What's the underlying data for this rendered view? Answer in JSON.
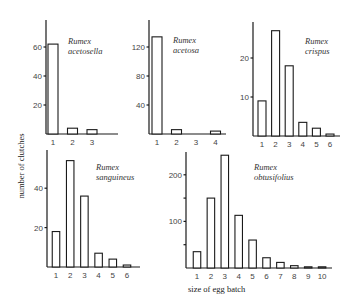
{
  "figure": {
    "ylabel": "number of clutches",
    "xlabel": "size of egg batch"
  },
  "chart_data": [
    {
      "type": "bar",
      "title": "Rumex acetosella",
      "title_lines": [
        "Rumex",
        "acetosella"
      ],
      "categories": [
        "1",
        "2",
        "3"
      ],
      "values": [
        62,
        4,
        3
      ],
      "xlabel": "size of egg batch",
      "ylabel": "number of clutches",
      "yticks": [
        20,
        40,
        60
      ],
      "ylim": [
        0,
        78
      ],
      "grid": false
    },
    {
      "type": "bar",
      "title": "Rumex acetosa",
      "title_lines": [
        "Rumex",
        "acetosa"
      ],
      "categories": [
        "1",
        "2",
        "3",
        "4"
      ],
      "values": [
        134,
        6,
        0,
        4
      ],
      "xlabel": "size of egg batch",
      "ylabel": "number of clutches",
      "yticks": [
        40,
        80,
        120
      ],
      "ylim": [
        0,
        157
      ],
      "grid": false
    },
    {
      "type": "bar",
      "title": "Rumex crispus",
      "title_lines": [
        "Rumex",
        "crispus"
      ],
      "categories": [
        "1",
        "2",
        "3",
        "4",
        "5",
        "6"
      ],
      "values": [
        9,
        27,
        18,
        3.5,
        2,
        0.5
      ],
      "xlabel": "size of egg batch",
      "ylabel": "number of clutches",
      "yticks": [
        10,
        20
      ],
      "ylim": [
        0,
        29
      ],
      "grid": false
    },
    {
      "type": "bar",
      "title": "Rumex sanguineus",
      "title_lines": [
        "Rumex",
        "sanguineus"
      ],
      "categories": [
        "1",
        "2",
        "3",
        "4",
        "5",
        "6"
      ],
      "values": [
        18,
        54,
        36,
        7,
        4,
        1
      ],
      "xlabel": "size of egg batch",
      "ylabel": "number of clutches",
      "yticks": [
        20,
        40
      ],
      "ylim": [
        0,
        59
      ],
      "grid": false
    },
    {
      "type": "bar",
      "title": "Rumex obtusifolius",
      "title_lines": [
        "Rumex",
        "obtusifolius"
      ],
      "categories": [
        "1",
        "2",
        "3",
        "4",
        "5",
        "6",
        "7",
        "8",
        "9",
        "10"
      ],
      "values": [
        35,
        150,
        242,
        113,
        60,
        22,
        12,
        5,
        1,
        0.5
      ],
      "xlabel": "size of egg batch",
      "ylabel": "number of clutches",
      "yticks": [
        50,
        100,
        150,
        200
      ],
      "ytick_labels": [
        "",
        "100",
        "",
        "200"
      ],
      "ylim": [
        0,
        250
      ],
      "grid": false
    }
  ],
  "layout": {
    "panels": [
      {
        "axis_x": 46,
        "baseline_y": 134,
        "top_y": 20,
        "x_end": 118,
        "px_per_unit": 1.45,
        "first_x": 53,
        "step": 19.5,
        "bar_w": 10,
        "label_x": 68,
        "label_y": 44,
        "tick_label_dx": -3
      },
      {
        "axis_x": 149,
        "baseline_y": 134,
        "top_y": 20,
        "x_end": 226,
        "px_per_unit": 0.725,
        "first_x": 157,
        "step": 19.5,
        "bar_w": 10,
        "label_x": 173,
        "label_y": 43,
        "tick_label_dx": -3
      },
      {
        "axis_x": 253,
        "baseline_y": 136,
        "top_y": 22,
        "x_end": 340,
        "px_per_unit": 3.9,
        "first_x": 262,
        "step": 13.6,
        "bar_w": 8,
        "label_x": 305,
        "label_y": 44,
        "tick_label_dx": -3
      },
      {
        "axis_x": 47,
        "baseline_y": 267,
        "top_y": 150,
        "x_end": 140,
        "px_per_unit": 1.97,
        "first_x": 56,
        "step": 14.2,
        "bar_w": 7.5,
        "label_x": 96,
        "label_y": 170,
        "tick_label_dx": -3
      },
      {
        "axis_x": 186,
        "baseline_y": 268,
        "top_y": 152,
        "x_end": 332,
        "px_per_unit": 0.466,
        "first_x": 197,
        "step": 13.9,
        "bar_w": 7.5,
        "label_x": 254,
        "label_y": 170,
        "tick_label_dx": -3
      }
    ]
  }
}
